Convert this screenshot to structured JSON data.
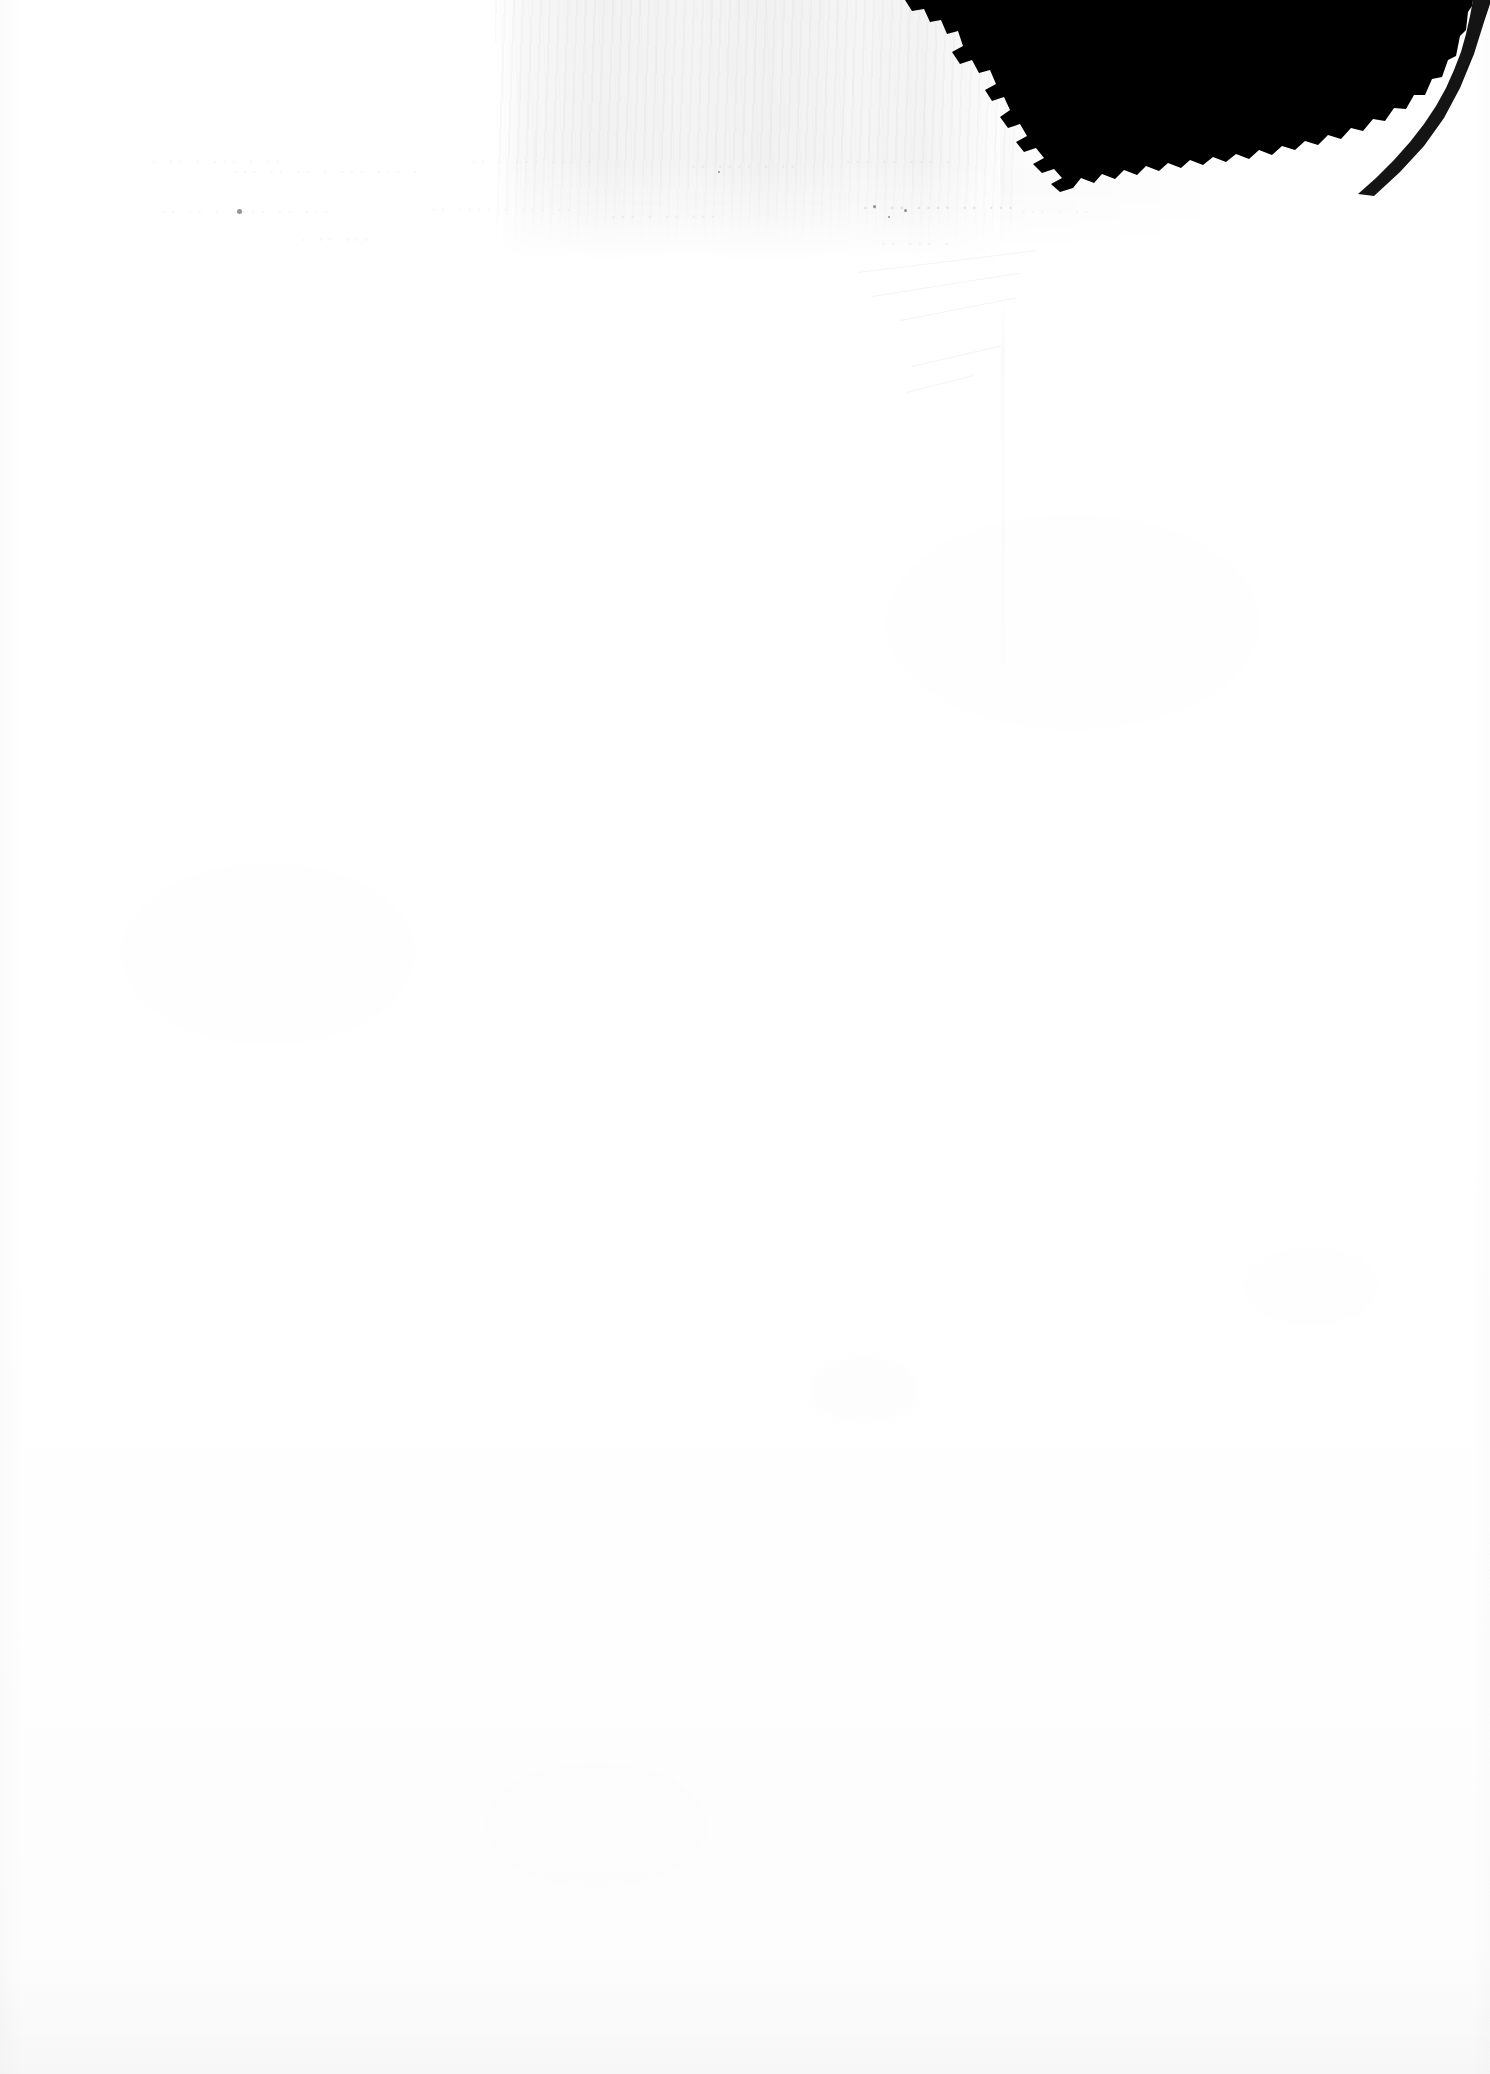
{
  "document": {
    "kind": "scanned-page",
    "orientation": "portrait",
    "page_width_px": 1490,
    "page_height_px": 2074,
    "visible_text": "",
    "note": "Blank scanned paper page; no legible rendered text."
  },
  "colors": {
    "paper": "#ffffff",
    "ink_blot": "#000000",
    "scan_band": "#ededed",
    "ghost_text": "#f0f0f0"
  },
  "artifacts": {
    "ink_blot": {
      "name": "black-corner-wedge",
      "description": "Large solid black wedge occupying the top-right corner with a jagged stepped lower-left edge",
      "left_px": 900,
      "top_px": 0,
      "right_px": 1465,
      "bottom_px": 192
    },
    "scan_band": {
      "name": "gray-vertical-band",
      "description": "Light gray textured vertical streak band across the upper page",
      "left_px": 495,
      "top_px": 0,
      "width_px": 520,
      "height_px": 262
    },
    "ghost_text": {
      "name": "bleed-through-traces",
      "description": "Extremely faint ghost impressions of writing in the upper page",
      "top_px": 148,
      "bottom_px": 235
    },
    "crease": {
      "name": "vertical-crease",
      "left_px": 1002,
      "top_px": 300,
      "height_px": 420
    }
  },
  "ghost_rows": [
    {
      "left": 150,
      "top": 150,
      "text": "·  ·· ·   ··· ·  ·· ",
      "weight": "faintest"
    },
    {
      "left": 232,
      "top": 160,
      "text": "··· ·· ··  ·  ··· ··· ·",
      "weight": "faintest"
    },
    {
      "left": 470,
      "top": 150,
      "text": "·· ·  ···  ··· ·",
      "weight": "faintest"
    },
    {
      "left": 690,
      "top": 155,
      "text": "·· ···· ·  ··",
      "weight": "faint"
    },
    {
      "left": 845,
      "top": 150,
      "text": "··· ·· ···  ·",
      "weight": "faint"
    },
    {
      "left": 160,
      "top": 200,
      "text": "·· ·· ·  ···· ··  ···",
      "weight": "faintest"
    },
    {
      "left": 430,
      "top": 198,
      "text": "··  ···· ·  ··· ··",
      "weight": "faintest"
    },
    {
      "left": 610,
      "top": 205,
      "text": "··· ·  ·· ···",
      "weight": "faint"
    },
    {
      "left": 862,
      "top": 196,
      "text": "·· ·· ···· ·· ···",
      "weight": "visible"
    },
    {
      "left": 1020,
      "top": 200,
      "text": "··· ·  ··",
      "weight": "faintest"
    },
    {
      "left": 300,
      "top": 228,
      "text": "· ··  ··· ·",
      "weight": "faintest"
    },
    {
      "left": 880,
      "top": 232,
      "text": "·· ··· ·",
      "weight": "faint"
    }
  ],
  "specks": [
    {
      "left": 237,
      "top": 209,
      "size": 5
    },
    {
      "left": 873,
      "top": 205,
      "size": 3
    },
    {
      "left": 904,
      "top": 209,
      "size": 3
    },
    {
      "left": 888,
      "top": 216,
      "size": 2
    },
    {
      "left": 718,
      "top": 171,
      "size": 2
    }
  ],
  "scratches": [
    {
      "left": 858,
      "top": 272,
      "width": 180,
      "angle": -7
    },
    {
      "left": 872,
      "top": 296,
      "width": 150,
      "angle": -9
    },
    {
      "left": 900,
      "top": 320,
      "width": 118,
      "angle": -11
    },
    {
      "left": 912,
      "top": 366,
      "width": 92,
      "angle": -13
    },
    {
      "left": 906,
      "top": 392,
      "width": 70,
      "angle": -14
    }
  ]
}
